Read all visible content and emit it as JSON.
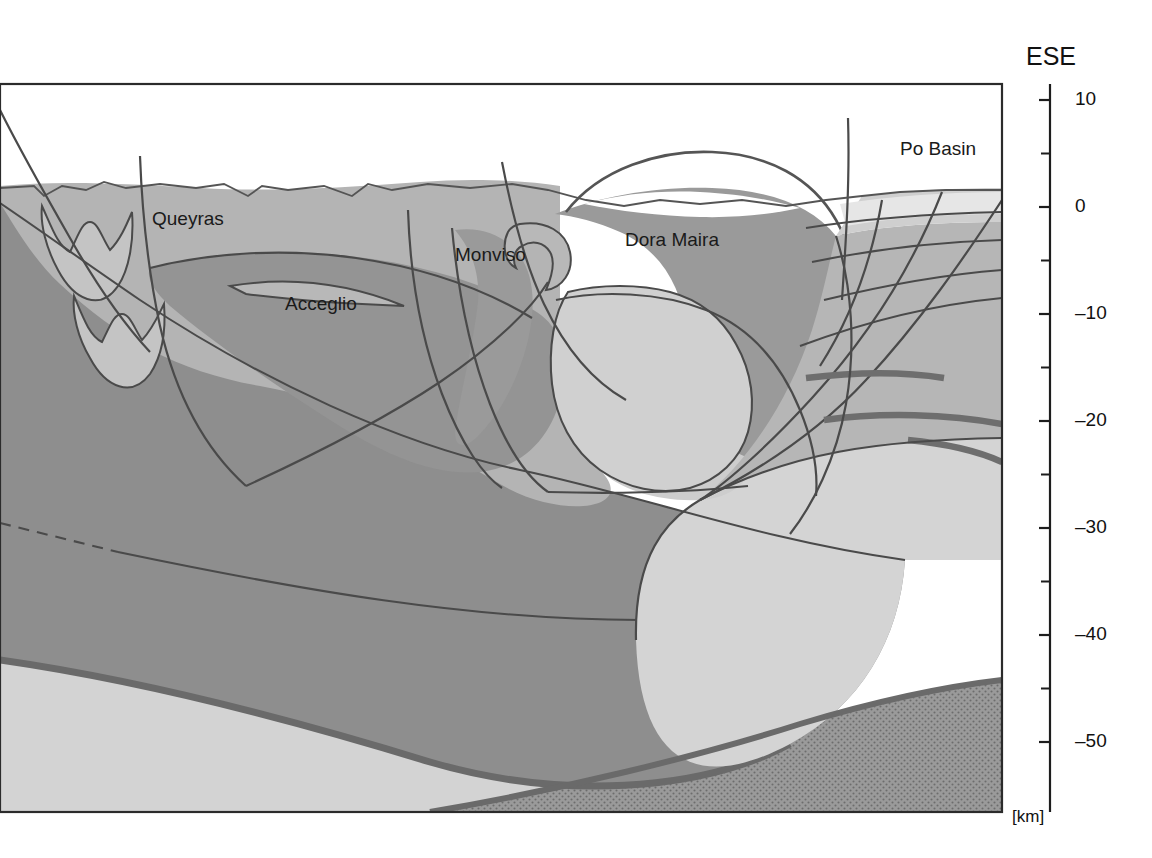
{
  "figure": {
    "kind": "geological-cross-section",
    "orientation_label": "ESE",
    "unit_label": "[km]",
    "frame_color": "#2b2b2b",
    "background": "#ffffff"
  },
  "axis": {
    "name": "depth-axis",
    "unit": "[km]",
    "labels": [
      "10",
      "0",
      "-10",
      "-20",
      "-30",
      "-40",
      "-50"
    ],
    "label_values": [
      10,
      0,
      -10,
      -20,
      -30,
      -40,
      -50
    ],
    "minor_tick_values": [
      5,
      -5,
      -15,
      -25,
      -35,
      -45
    ],
    "range": [
      -55,
      12
    ],
    "tick_label_x": 1075,
    "axis_x": 1050
  },
  "labels": [
    {
      "id": "queyras",
      "text": "Queyras",
      "x": 152,
      "y": 220
    },
    {
      "id": "acceglio",
      "text": "Acceglio",
      "x": 285,
      "y": 305
    },
    {
      "id": "monviso",
      "text": "Monviso",
      "x": 455,
      "y": 256
    },
    {
      "id": "dora-maira",
      "text": "Dora Maira",
      "x": 625,
      "y": 241
    },
    {
      "id": "po-basin",
      "text": "Po Basin",
      "x": 900,
      "y": 150
    },
    {
      "id": "ese",
      "text": "ESE",
      "x": 1026,
      "y": 58
    },
    {
      "id": "km",
      "text": "[km]",
      "x": 1012,
      "y": 818
    }
  ],
  "palette": {
    "white": "#ffffff",
    "lightest": "#e4e4e4",
    "light": "#d3d3d3",
    "light_mid": "#c9c9c9",
    "mid": "#b4b4b4",
    "mid_dark": "#a8a8a8",
    "dark": "#8e8e8e",
    "darker": "#7e7e7e",
    "marker_band": "#6e6e6e",
    "line": "#4a4a4a",
    "stipple": "#8a8a8a"
  },
  "units": [
    {
      "id": "penninic-upper",
      "name": "Queyras / upper Penninic nappes",
      "tone": "mid"
    },
    {
      "id": "acceglio-unit",
      "name": "Acceglio unit",
      "tone": "dark"
    },
    {
      "id": "monviso-unit",
      "name": "Monviso ophiolite sliver",
      "tone": "dark"
    },
    {
      "id": "dora-maira-dome",
      "name": "Dora Maira massif",
      "tone": "dark"
    },
    {
      "id": "dora-maira-core",
      "name": "Dora Maira core",
      "tone": "light"
    },
    {
      "id": "european-crust",
      "name": "European lower crust",
      "tone": "darker"
    },
    {
      "id": "adriatic-crust",
      "name": "Adriatic lower crust",
      "tone": "light"
    },
    {
      "id": "mantle",
      "name": "Mantle (stippled)",
      "tone": "stipple"
    },
    {
      "id": "po-basin-fill",
      "name": "Po Basin sediments",
      "tone": "lightest"
    }
  ]
}
